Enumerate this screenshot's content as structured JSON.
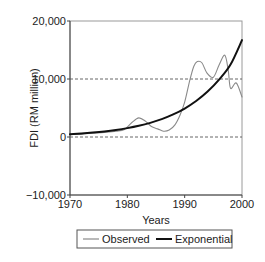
{
  "chart_data": {
    "type": "line",
    "title": "",
    "xlabel": "Years",
    "ylabel": "FDI (RM million)",
    "xlim": [
      1970,
      2000
    ],
    "ylim": [
      -10000,
      20000
    ],
    "x_ticks": [
      1970,
      1980,
      1990,
      2000
    ],
    "x_tick_labels": [
      "1970",
      "1980",
      "1990",
      "2000"
    ],
    "y_ticks": [
      -10000,
      0,
      10000,
      20000
    ],
    "y_tick_labels": [
      "−10,000",
      "0",
      "10,000",
      "20,000"
    ],
    "gridlines": {
      "style": "dashed",
      "y_values": [
        0,
        10000
      ]
    },
    "legend": {
      "position": "bottom",
      "entries": [
        "Observed",
        "Exponential"
      ]
    },
    "series": [
      {
        "name": "Observed",
        "color": "#8a8a8a",
        "width": 1.1,
        "x": [
          1970,
          1972,
          1974,
          1976,
          1978,
          1979.5,
          1980.8,
          1982,
          1983.2,
          1984.2,
          1985.3,
          1986.3,
          1987.3,
          1988.3,
          1989.2,
          1990,
          1990.9,
          1991.6,
          1992.2,
          1993,
          1993.9,
          1995,
          1996,
          1997,
          1997.6,
          1998,
          1999,
          2000
        ],
        "values": [
          400,
          500,
          650,
          800,
          1000,
          1300,
          2500,
          3300,
          2700,
          1800,
          1400,
          1000,
          1200,
          2100,
          3800,
          6000,
          9800,
          12200,
          13000,
          12800,
          11000,
          10300,
          12400,
          14100,
          11500,
          8400,
          9300,
          6900
        ]
      },
      {
        "name": "Exponential",
        "color": "#111111",
        "width": 2,
        "x": [
          1970,
          1972,
          1974,
          1976,
          1978,
          1980,
          1982,
          1984,
          1986,
          1988,
          1990,
          1992,
          1994,
          1996,
          1998,
          2000
        ],
        "values": [
          480,
          600,
          760,
          960,
          1210,
          1530,
          1930,
          2440,
          3080,
          3890,
          4910,
          6200,
          7830,
          9890,
          12490,
          16700
        ]
      }
    ]
  }
}
